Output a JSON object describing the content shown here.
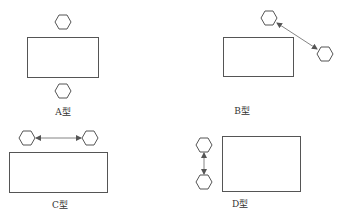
{
  "diagram": {
    "panels": [
      {
        "id": "A",
        "label": "A型",
        "description": "Two hexagons, one above and one below the rectangle"
      },
      {
        "id": "B",
        "label": "B型",
        "description": "Two hexagons diagonal at upper-right of rectangle, connected by double-headed arrow"
      },
      {
        "id": "C",
        "label": "C型",
        "description": "Two hexagons side by side above rectangle, connected by horizontal double-headed arrow"
      },
      {
        "id": "D",
        "label": "D型",
        "description": "Two hexagons stacked on left of rectangle, connected by vertical double-headed arrow"
      }
    ],
    "colors": {
      "stroke": "#555555",
      "background": "#ffffff"
    }
  }
}
